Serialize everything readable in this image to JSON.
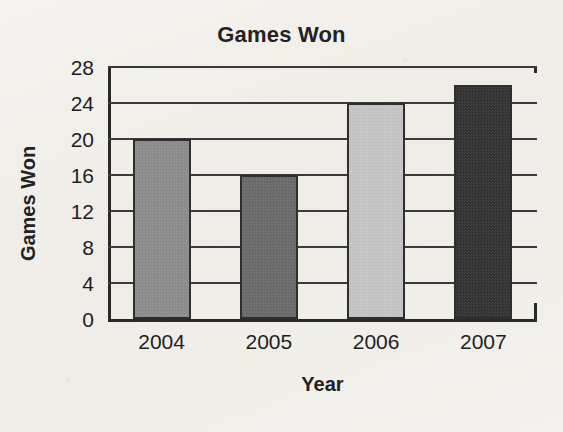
{
  "chart_data": {
    "type": "bar",
    "title": "Games Won",
    "xlabel": "Year",
    "ylabel": "Games Won",
    "categories": [
      "2004",
      "2005",
      "2006",
      "2007"
    ],
    "values": [
      20,
      16,
      24,
      26
    ],
    "series": [
      {
        "name": "Games Won",
        "values": [
          20,
          16,
          24,
          26
        ]
      }
    ],
    "ylim": [
      0,
      28
    ],
    "yticks": [
      0,
      4,
      8,
      12,
      16,
      20,
      24,
      28
    ],
    "ytick_labels": [
      "0",
      "4",
      "8",
      "12",
      "16",
      "20",
      "24",
      "28"
    ],
    "xlim": [
      0,
      4
    ],
    "grid": "horizontal",
    "legend": "none",
    "bar_colors": [
      "#8d8d8d",
      "#6b6b6b",
      "#c6c6c6",
      "#343434"
    ],
    "bar_edge_color": "#2e2e2e",
    "axis_color": "#2a2a2a",
    "background_color": "#f2f0ec",
    "text_color": "#1e1e1e"
  }
}
